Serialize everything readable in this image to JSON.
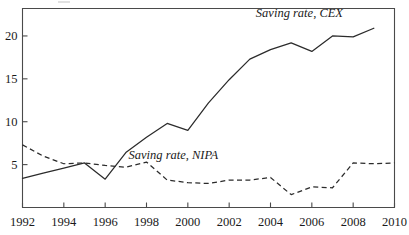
{
  "chart_data": {
    "type": "line",
    "title": "",
    "subtitle": "",
    "xlabel": "",
    "ylabel": "",
    "xlim": [
      1992,
      2010
    ],
    "ylim": [
      0,
      23.2
    ],
    "xticks": [
      1992,
      1994,
      1996,
      1998,
      2000,
      2002,
      2004,
      2006,
      2008,
      2010
    ],
    "xtick_labels": [
      "1992",
      "1994",
      "1996",
      "1998",
      "2000",
      "2002",
      "2004",
      "2006",
      "2008",
      "2010"
    ],
    "yticks": [
      5,
      10,
      15,
      20
    ],
    "ytick_labels": [
      "5",
      "10",
      "15",
      "20"
    ],
    "grid": false,
    "legend_position": "inline-annotation",
    "x": [
      1992,
      1993,
      1994,
      1995,
      1996,
      1997,
      1998,
      1999,
      2000,
      2001,
      2002,
      2003,
      2004,
      2005,
      2006,
      2007,
      2008,
      2009
    ],
    "series": [
      {
        "name": "Saving rate, CEX",
        "style": "solid",
        "label_x": 2005.4,
        "label_y": 22.2,
        "values": [
          3.4,
          4.0,
          4.6,
          5.2,
          3.3,
          6.4,
          8.2,
          9.8,
          9.0,
          12.2,
          14.9,
          17.3,
          18.4,
          19.2,
          18.2,
          20.0,
          19.9,
          20.9
        ]
      },
      {
        "name": "Saving rate, NIPA",
        "style": "dashed",
        "label_x": 1999.3,
        "label_y": 5.6,
        "values": [
          7.3,
          6.0,
          5.1,
          5.2,
          4.9,
          4.7,
          5.3,
          3.2,
          2.9,
          2.8,
          3.2,
          3.2,
          3.5,
          1.5,
          2.4,
          2.3,
          5.2,
          5.1
        ]
      }
    ],
    "series_extra_point": {
      "x": 2010,
      "cex": null,
      "nipa": 5.2
    }
  },
  "axis": {
    "frame": "left-top-right-bottom-box"
  }
}
